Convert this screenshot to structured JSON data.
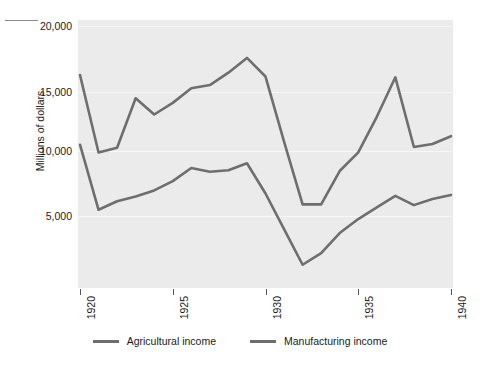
{
  "chart_data": {
    "type": "line",
    "title": "",
    "xlabel": "",
    "ylabel": "Millions of dollars",
    "x": [
      1920,
      1921,
      1922,
      1923,
      1924,
      1925,
      1926,
      1927,
      1928,
      1929,
      1930,
      1931,
      1932,
      1933,
      1934,
      1935,
      1936,
      1937,
      1938,
      1939,
      1940
    ],
    "xlim": [
      1920,
      1940
    ],
    "ylim": [
      3200,
      20500
    ],
    "xticks": [
      "1920",
      "1925",
      "1930",
      "1935",
      "1940"
    ],
    "yticks": [
      "5,000",
      "10,000",
      "15,000",
      "20,000"
    ],
    "ytick_values": [
      5000,
      10000,
      15000,
      20000
    ],
    "grid": "horizontal-white-on-gray",
    "legend_position": "bottom-center",
    "series": [
      {
        "name": "Agricultural income",
        "color": "#6e6e6e",
        "values": [
          12450,
          8250,
          8800,
          9100,
          9500,
          10100,
          10950,
          10700,
          10800,
          11250,
          9300,
          7000,
          4700,
          5450,
          6750,
          7650,
          8400,
          9150,
          8550,
          8950,
          9200
        ]
      },
      {
        "name": "Manufacturing income",
        "color": "#6e6e6e",
        "values": [
          16950,
          11950,
          12250,
          15450,
          14400,
          15150,
          16100,
          16300,
          17100,
          18050,
          16850,
          12650,
          8600,
          8600,
          10750,
          11950,
          14250,
          16800,
          12300,
          12500,
          13000
        ]
      }
    ]
  },
  "legend": {
    "items": [
      {
        "label": "Agricultural income",
        "swatch": "line-swatch-agricultural"
      },
      {
        "label": "Manufacturing income",
        "swatch": "line-swatch-manufacturing"
      }
    ]
  },
  "axes": {
    "y_axis_title": "Millions of dollars",
    "y_tick_labels": [
      "20,000",
      "15,000",
      "10,000",
      "5,000"
    ],
    "x_tick_labels": [
      "1920",
      "1925",
      "1930",
      "1935",
      "1940"
    ]
  },
  "colors": {
    "plot_background": "#ebebeb",
    "gridline": "#f7f7f7",
    "line": "#6e6e6e",
    "text": "#1a1a1a",
    "page_background": "#ffffff"
  }
}
